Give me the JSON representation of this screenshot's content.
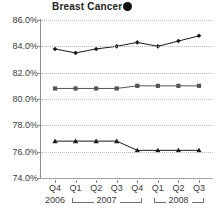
{
  "chart_data": {
    "type": "line",
    "title": "Breast Cancer",
    "title_marker": "filled-diamond-marker",
    "xlabel": "",
    "ylabel": "",
    "ylim": [
      74.0,
      86.0
    ],
    "ytick_step": 2.0,
    "ytick_labels": [
      "86.0%",
      "84.0%",
      "82.0%",
      "80.0%",
      "78.0%",
      "76.0%",
      "74.0%"
    ],
    "ytick_values": [
      86.0,
      84.0,
      82.0,
      80.0,
      78.0,
      76.0,
      74.0
    ],
    "grid": true,
    "legend": "none",
    "categories": [
      "Q4",
      "Q1",
      "Q2",
      "Q3",
      "Q4",
      "Q1",
      "Q2",
      "Q3"
    ],
    "year_groups": [
      {
        "label": "2006",
        "start_index": 0,
        "end_index": 0,
        "bracket": false
      },
      {
        "label": "2007",
        "start_index": 1,
        "end_index": 4,
        "bracket": true
      },
      {
        "label": "2008",
        "start_index": 5,
        "end_index": 7,
        "bracket": true
      }
    ],
    "series": [
      {
        "name": "Series 1",
        "marker": "diamond",
        "color": "#1a1a1a",
        "values": [
          83.8,
          83.5,
          83.8,
          84.0,
          84.3,
          84.0,
          84.4,
          84.8
        ]
      },
      {
        "name": "Series 2",
        "marker": "square",
        "color": "#555555",
        "values": [
          80.8,
          80.8,
          80.8,
          80.8,
          81.0,
          81.0,
          81.0,
          81.0
        ]
      },
      {
        "name": "Series 3",
        "marker": "triangle",
        "color": "#1a1a1a",
        "values": [
          76.8,
          76.8,
          76.8,
          76.8,
          76.1,
          76.1,
          76.1,
          76.1
        ]
      }
    ]
  }
}
